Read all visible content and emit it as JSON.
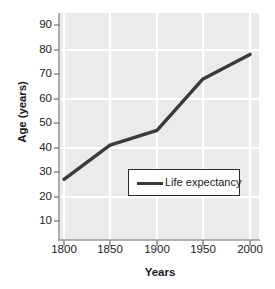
{
  "chart_data": {
    "type": "line",
    "title": "",
    "xlabel": "Years",
    "ylabel": "Age (years)",
    "x": [
      1800,
      1850,
      1900,
      1950,
      2000
    ],
    "xtick_labels": [
      "1800",
      "1850",
      "1900",
      "1950",
      "2000"
    ],
    "ytick_labels": [
      "10",
      "20",
      "30",
      "40",
      "50",
      "60",
      "70",
      "80",
      "90"
    ],
    "ytick_values": [
      10,
      20,
      30,
      40,
      50,
      60,
      70,
      80,
      90
    ],
    "xlim": [
      1787,
      1800
    ],
    "ylim": [
      2,
      96
    ],
    "grid": true,
    "grid_color": "#ffffff",
    "plot_background": "#ebebeb",
    "line_color": "#3a3a3a",
    "axis_color": "#7a7a7a",
    "legend_position": "inside-lower-right",
    "series": [
      {
        "name": "Life expectancy",
        "values": [
          27,
          41,
          47,
          68,
          78
        ]
      }
    ]
  }
}
